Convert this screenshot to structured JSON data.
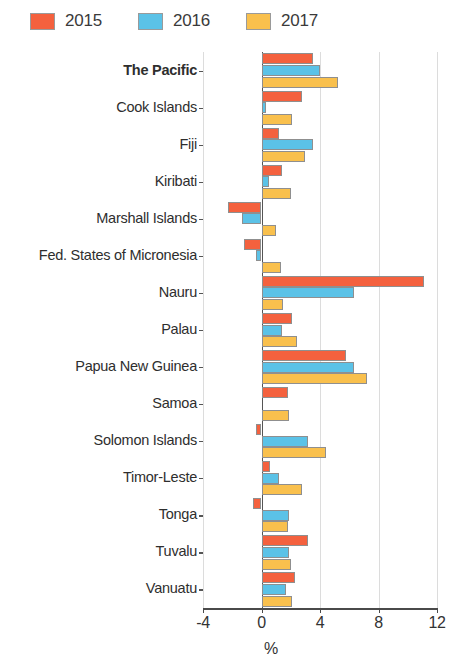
{
  "legend": {
    "items": [
      {
        "label": "2015",
        "color": "#F4613E",
        "name": "legend-2015"
      },
      {
        "label": "2016",
        "color": "#5BC2E7",
        "name": "legend-2016"
      },
      {
        "label": "2017",
        "color": "#F9C04D",
        "name": "legend-2017"
      }
    ]
  },
  "axis": {
    "x_ticks": [
      "-4",
      "0",
      "4",
      "8",
      "12"
    ],
    "x_title": "%"
  },
  "chart_data": {
    "type": "bar",
    "orientation": "horizontal",
    "title": "",
    "subtitle": "",
    "xlabel": "%",
    "ylabel": "",
    "xlim": [
      -4,
      12
    ],
    "xticks": [
      -4,
      0,
      4,
      8,
      12
    ],
    "grid": true,
    "legend_position": "top-left",
    "categories": [
      "The Pacific",
      "Cook Islands",
      "Fiji",
      "Kiribati",
      "Marshall Islands",
      "Fed. States of Micronesia",
      "Nauru",
      "Palau",
      "Papua New Guinea",
      "Samoa",
      "Solomon Islands",
      "Timor-Leste",
      "Tonga",
      "Tuvalu",
      "Vanuatu"
    ],
    "highlight_category": "The Pacific",
    "series": [
      {
        "name": "2015",
        "color": "#F4613E",
        "values": [
          3.5,
          2.8,
          1.2,
          1.4,
          -2.3,
          -1.2,
          11.1,
          2.1,
          5.8,
          1.8,
          -0.4,
          0.6,
          -0.6,
          3.2,
          2.3
        ]
      },
      {
        "name": "2016",
        "color": "#5BC2E7",
        "values": [
          4.0,
          0.3,
          3.5,
          0.5,
          -1.3,
          -0.4,
          6.3,
          1.4,
          6.3,
          0.0,
          3.2,
          1.2,
          1.9,
          1.9,
          1.7
        ]
      },
      {
        "name": "2017",
        "color": "#F9C04D",
        "values": [
          5.2,
          2.1,
          3.0,
          2.0,
          1.0,
          1.3,
          1.5,
          2.4,
          7.2,
          1.9,
          4.4,
          2.8,
          1.8,
          2.0,
          2.1
        ]
      }
    ]
  }
}
